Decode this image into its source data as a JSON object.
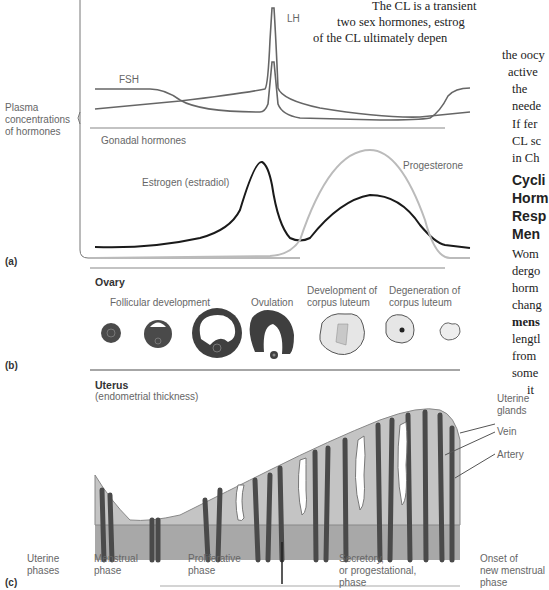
{
  "book_text": {
    "lines": [
      "The CL is a transient",
      "two sex hormones, estrog",
      "of the CL ultimately depen",
      "the oocy",
      "active",
      "the",
      "neede",
      "If fer",
      "CL sc",
      "in Ch"
    ],
    "heading_lines": [
      "Cycli",
      "Horm",
      "Resp",
      "Men"
    ],
    "body2_lines": [
      "Wom",
      "dergo",
      "horm",
      "chang",
      "mens",
      "lengtl",
      "from",
      "some",
      "it"
    ]
  },
  "panel_a": {
    "letter": "(a)",
    "side_label": [
      "Plasma",
      "concentrations",
      "of hormones"
    ],
    "gonadotropins": {
      "fsh_label": "FSH",
      "lh_label": "LH"
    },
    "gonadal": {
      "title": "Gonadal hormones",
      "estrogen_label": "Estrogen (estradiol)",
      "progesterone_label": "Progesterone"
    }
  },
  "panel_b": {
    "letter": "(b)",
    "title": "Ovary",
    "stages": [
      {
        "label": "Follicular development"
      },
      {
        "label": "Ovulation"
      },
      {
        "label": "Development of\ncorpus luteum",
        "line1": "Development of",
        "line2": "corpus luteum"
      },
      {
        "label": "Degeneration of\ncorpus luteum",
        "line1": "Degeneration of",
        "line2": "corpus luteum"
      }
    ]
  },
  "panel_c": {
    "letter": "(c)",
    "title": "Uterus",
    "subtitle": "(endometrial thickness)",
    "callouts": [
      "Uterine",
      "glands",
      "Vein",
      "Artery"
    ],
    "phases_label": [
      "Uterine",
      "phases"
    ],
    "phases": [
      {
        "line1": "Menstrual",
        "line2": "phase"
      },
      {
        "line1": "Proliferative",
        "line2": "phase"
      },
      {
        "line1": "Secretory,",
        "line2": "or progestational,",
        "line3": "phase"
      },
      {
        "line1": "Onset of",
        "line2": "new menstrual",
        "line3": "phase"
      }
    ]
  },
  "colors": {
    "gonadotropin_line": "#666666",
    "estrogen_line": "#1a1a1a",
    "progesterone_line": "#bbbbbb",
    "endometrium_fill": "#bdbdbd",
    "basal_layer": "#a8a8a8",
    "vessel": "#4a4a4a"
  }
}
